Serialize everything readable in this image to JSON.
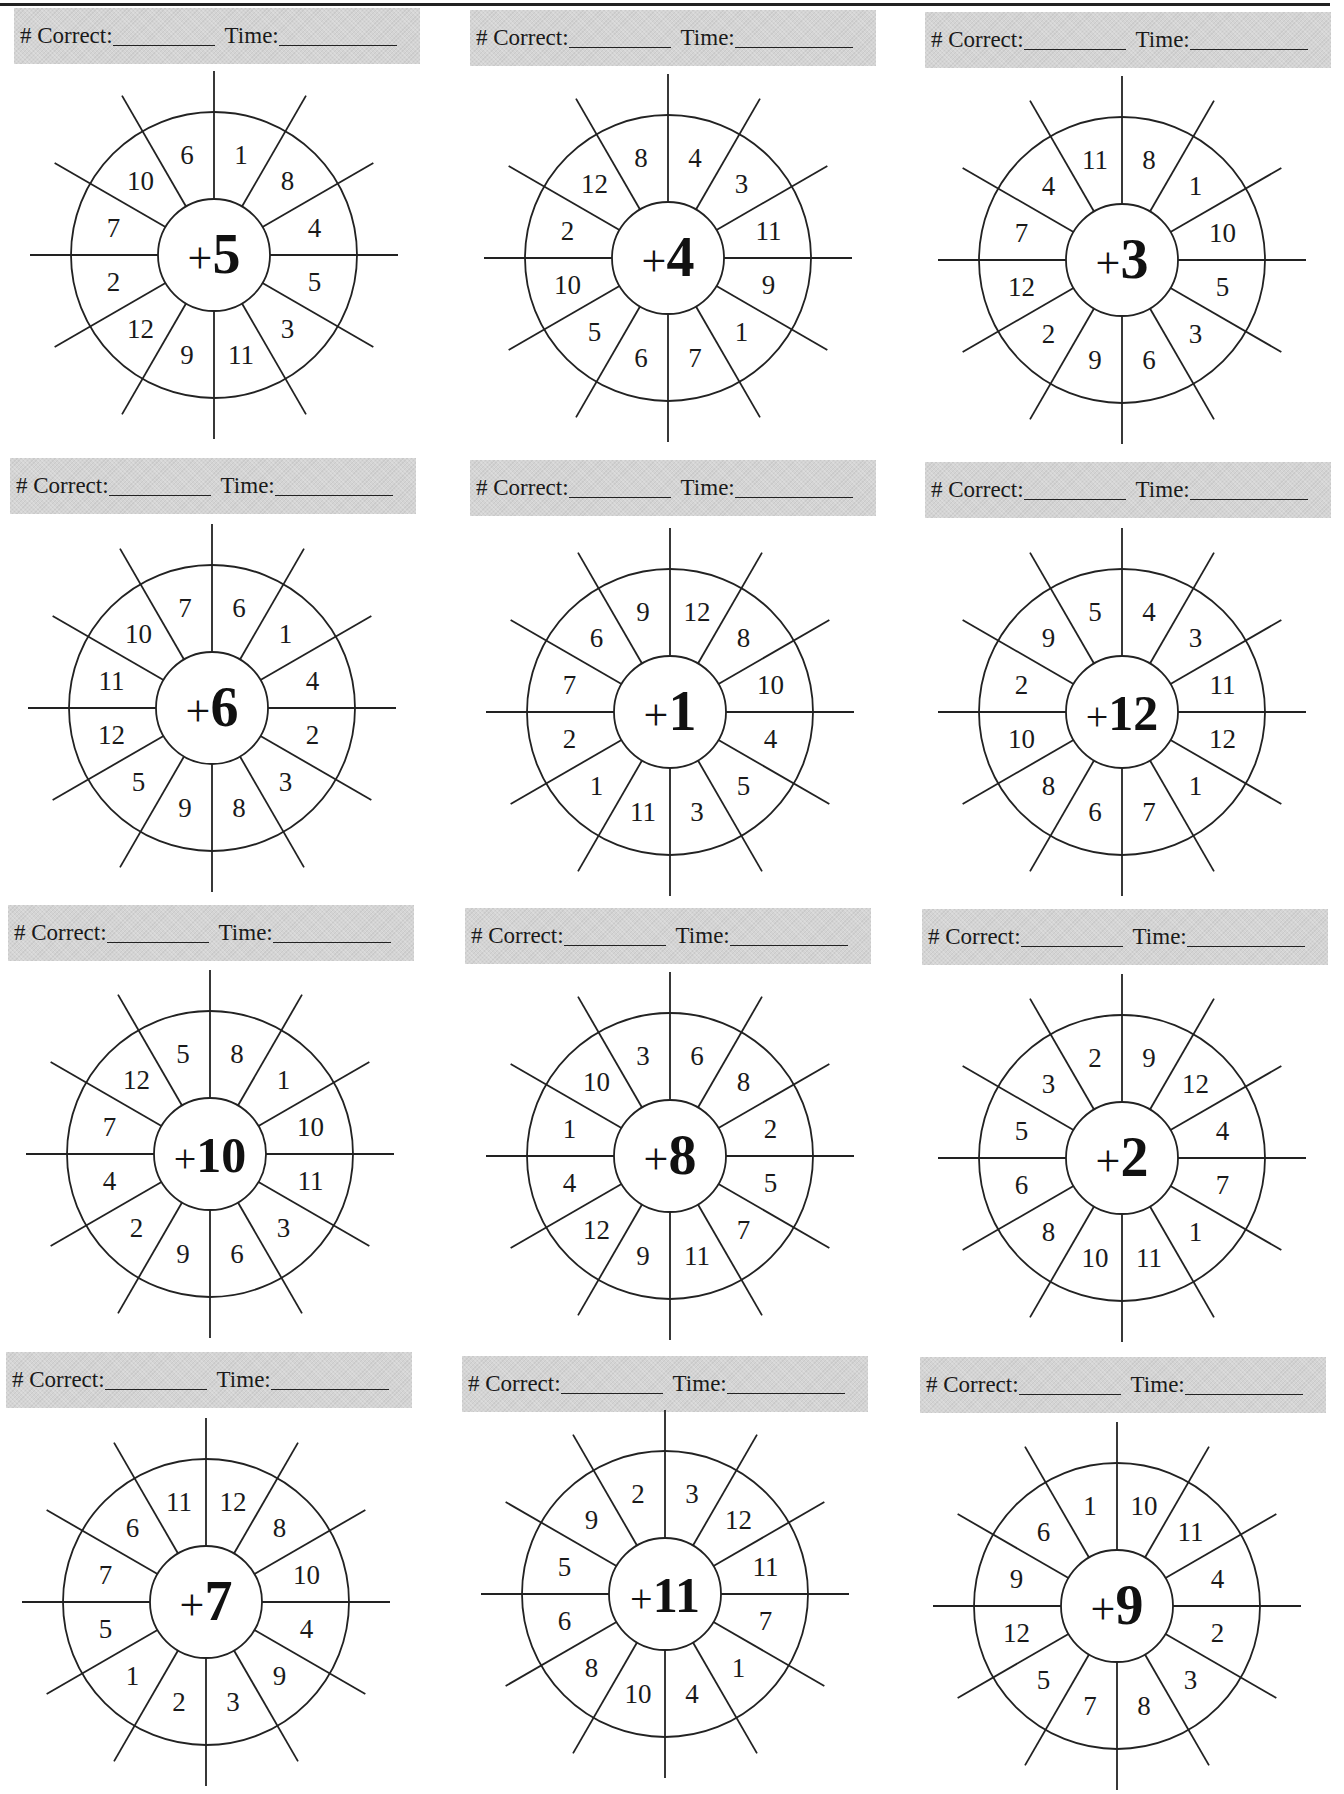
{
  "header": {
    "correct_label": "# Correct:",
    "time_label": "Time:"
  },
  "wheels": [
    {
      "center": "+",
      "addend": "5",
      "numbers": [
        "1",
        "8",
        "4",
        "5",
        "3",
        "11",
        "9",
        "12",
        "2",
        "7",
        "10",
        "6"
      ]
    },
    {
      "center": "+",
      "addend": "4",
      "numbers": [
        "4",
        "3",
        "11",
        "9",
        "1",
        "7",
        "6",
        "5",
        "10",
        "2",
        "12",
        "8"
      ]
    },
    {
      "center": "+",
      "addend": "3",
      "numbers": [
        "8",
        "1",
        "10",
        "5",
        "3",
        "6",
        "9",
        "2",
        "12",
        "7",
        "4",
        "11"
      ]
    },
    {
      "center": "+",
      "addend": "6",
      "numbers": [
        "6",
        "1",
        "4",
        "2",
        "3",
        "8",
        "9",
        "5",
        "12",
        "11",
        "10",
        "7"
      ]
    },
    {
      "center": "+",
      "addend": "1",
      "numbers": [
        "12",
        "8",
        "10",
        "4",
        "5",
        "3",
        "11",
        "1",
        "2",
        "7",
        "6",
        "9"
      ]
    },
    {
      "center": "+",
      "addend": "12",
      "numbers": [
        "4",
        "3",
        "11",
        "12",
        "1",
        "7",
        "6",
        "8",
        "10",
        "2",
        "9",
        "5"
      ]
    },
    {
      "center": "+",
      "addend": "10",
      "numbers": [
        "8",
        "1",
        "10",
        "11",
        "3",
        "6",
        "9",
        "2",
        "4",
        "7",
        "12",
        "5"
      ]
    },
    {
      "center": "+",
      "addend": "8",
      "numbers": [
        "6",
        "8",
        "2",
        "5",
        "7",
        "11",
        "9",
        "12",
        "4",
        "1",
        "10",
        "3"
      ]
    },
    {
      "center": "+",
      "addend": "2",
      "numbers": [
        "9",
        "12",
        "4",
        "7",
        "1",
        "11",
        "10",
        "8",
        "6",
        "5",
        "3",
        "2"
      ]
    },
    {
      "center": "+",
      "addend": "7",
      "numbers": [
        "12",
        "8",
        "10",
        "4",
        "9",
        "3",
        "2",
        "1",
        "5",
        "7",
        "6",
        "11"
      ]
    },
    {
      "center": "+",
      "addend": "11",
      "numbers": [
        "3",
        "12",
        "11",
        "7",
        "1",
        "4",
        "10",
        "8",
        "6",
        "5",
        "9",
        "2"
      ]
    },
    {
      "center": "+",
      "addend": "9",
      "numbers": [
        "10",
        "11",
        "4",
        "2",
        "3",
        "8",
        "7",
        "5",
        "12",
        "9",
        "6",
        "1"
      ]
    }
  ]
}
